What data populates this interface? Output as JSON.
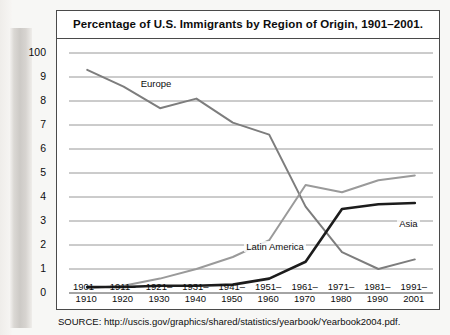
{
  "figure": {
    "title": "Percentage of U.S. Immigrants by Region of Origin, 1901–2001.",
    "source": "SOURCE: http://uscis.gov/graphics/shared/statistics/yearbook/Yearbook2004.pdf."
  },
  "chart_data": {
    "type": "line",
    "title": "Percentage of U.S. Immigrants by Region of Origin, 1901–2001.",
    "xlabel": "",
    "ylabel": "",
    "ylim": [
      0,
      10
    ],
    "grid": true,
    "legend_position": "inline-labels",
    "ytick_labels": [
      "100",
      "9",
      "8",
      "7",
      "6",
      "5",
      "4",
      "3",
      "2",
      "1",
      "0"
    ],
    "ytick_values": [
      10,
      9,
      8,
      7,
      6,
      5,
      4,
      3,
      2,
      1,
      0
    ],
    "categories": [
      "1901–1910",
      "1911–1920",
      "1921–1930",
      "1931–1940",
      "1941–1950",
      "1951–1960",
      "1961–1970",
      "1971–1980",
      "1981–1990",
      "1991–2001"
    ],
    "categories_line1": [
      "1901–",
      "1911–",
      "1921–",
      "1931–",
      "1941–",
      "1951–",
      "1961–",
      "1971–",
      "1981–",
      "1991–"
    ],
    "categories_line2": [
      "1910",
      "1920",
      "1930",
      "1940",
      "1950",
      "1960",
      "1970",
      "1980",
      "1990",
      "2001"
    ],
    "series": [
      {
        "name": "Europe",
        "color": "#7d7d7d",
        "values": [
          9.3,
          8.6,
          7.7,
          8.1,
          7.1,
          6.6,
          3.6,
          1.7,
          1.0,
          1.4
        ]
      },
      {
        "name": "Latin America",
        "color": "#9a9a9a",
        "values": [
          0.2,
          0.3,
          0.6,
          1.0,
          1.5,
          2.2,
          4.5,
          4.2,
          4.7,
          4.9
        ]
      },
      {
        "name": "Asia",
        "color": "#1c1c1c",
        "values": [
          0.25,
          0.25,
          0.3,
          0.3,
          0.35,
          0.6,
          1.3,
          3.5,
          3.7,
          3.75
        ]
      }
    ]
  }
}
